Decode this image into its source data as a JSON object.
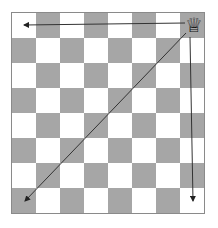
{
  "diagram": {
    "board": {
      "rows": 8,
      "cols": 8,
      "light_color": "#ffffff",
      "dark_color": "#a6a6a6"
    },
    "piece": {
      "name": "queen",
      "glyph": "♕",
      "square": "top-right"
    },
    "arrows": [
      {
        "name": "arrow-left",
        "direction": "west"
      },
      {
        "name": "arrow-down",
        "direction": "south"
      },
      {
        "name": "arrow-diagonal",
        "direction": "south-west"
      }
    ]
  }
}
